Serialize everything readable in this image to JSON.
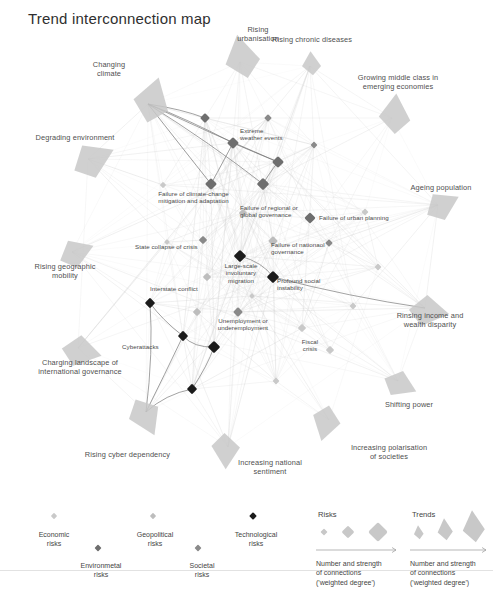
{
  "title": "Trend interconnection map",
  "colors": {
    "economic": "#c9c9c9",
    "environmental": "#6e6e6e",
    "geopolitical": "#bdbdbd",
    "societal": "#8a8a8a",
    "technological": "#1b1b1b",
    "trend_fill": "#c8c8c8",
    "edge": "#cfcfcf",
    "edge_strong": "#6d6d6d",
    "text": "#4a4a4a"
  },
  "chart_data": {
    "type": "network",
    "title": "Trend interconnection map",
    "xlabel": "",
    "ylabel": "",
    "grid": false,
    "legend_position": "bottom",
    "node_categories": [
      {
        "key": "economic",
        "label": "Economic\nrisks",
        "color": "#c9c9c9"
      },
      {
        "key": "environmental",
        "label": "Environmetal\nrisks",
        "color": "#6e6e6e"
      },
      {
        "key": "geopolitical",
        "label": "Geopolitical\nrisks",
        "color": "#bdbdbd"
      },
      {
        "key": "societal",
        "label": "Societal\nrisks",
        "color": "#8a8a8a"
      },
      {
        "key": "technological",
        "label": "Technological\nrisks",
        "color": "#1b1b1b"
      }
    ],
    "trends": [
      {
        "id": "t_climate",
        "label": "Changing\nclimate",
        "x": 148,
        "y": 104,
        "size": 46,
        "rot": 22,
        "lx": 74,
        "ly": 60,
        "lw": 70
      },
      {
        "id": "t_urban",
        "label": "Rising\nurbanisation",
        "x": 240,
        "y": 62,
        "size": 44,
        "rot": -6,
        "lx": 227,
        "ly": 25,
        "lw": 62
      },
      {
        "id": "t_chronic",
        "label": "Rising chronic diseases",
        "x": 310,
        "y": 66,
        "size": 24,
        "rot": 2,
        "lx": 252,
        "ly": 35,
        "lw": 120
      },
      {
        "id": "t_middleclass",
        "label": "Growing middle class in\nemerging economies",
        "x": 392,
        "y": 118,
        "size": 40,
        "rot": 10,
        "lx": 333,
        "ly": 73,
        "lw": 130
      },
      {
        "id": "t_degrading",
        "label": "Degrading environment",
        "x": 88,
        "y": 159,
        "size": 44,
        "rot": 70,
        "lx": 20,
        "ly": 133,
        "lw": 110
      },
      {
        "id": "t_ageing",
        "label": "Ageing population",
        "x": 438,
        "y": 205,
        "size": 36,
        "rot": 68,
        "lx": 396,
        "ly": 183,
        "lw": 90
      },
      {
        "id": "t_geomobility",
        "label": "Rising geographic\nmobility",
        "x": 72,
        "y": 252,
        "size": 36,
        "rot": 74,
        "lx": 20,
        "ly": 262,
        "lw": 90
      },
      {
        "id": "t_income",
        "label": "Rinsing income and\nwealth disparity",
        "x": 425,
        "y": 308,
        "size": 40,
        "rot": 104,
        "lx": 374,
        "ly": 311,
        "lw": 112
      },
      {
        "id": "t_intgov",
        "label": "Charging landscape of\ninternational governance",
        "x": 78,
        "y": 348,
        "size": 40,
        "rot": 108,
        "lx": 18,
        "ly": 358,
        "lw": 124
      },
      {
        "id": "t_shifting",
        "label": "Shifting power",
        "x": 398,
        "y": 381,
        "size": 34,
        "rot": 120,
        "lx": 369,
        "ly": 400,
        "lw": 80
      },
      {
        "id": "t_cyberdep",
        "label": "Rising cyber dependency",
        "x": 146,
        "y": 412,
        "size": 40,
        "rot": 160,
        "lx": 70,
        "ly": 450,
        "lw": 115
      },
      {
        "id": "t_natsentiment",
        "label": "Increasing national\nsentiment",
        "x": 228,
        "y": 447,
        "size": 36,
        "rot": 186,
        "lx": 222,
        "ly": 458,
        "lw": 96
      },
      {
        "id": "t_polarisation",
        "label": "Increasing polarisation\nof societies",
        "x": 329,
        "y": 420,
        "size": 36,
        "rot": 200,
        "lx": 329,
        "ly": 443,
        "lw": 120
      }
    ],
    "risk_nodes": [
      {
        "id": "r01",
        "label": "Extreme\nweather events",
        "x": 233,
        "y": 143,
        "cat": "environmental",
        "size": 8.5,
        "lx": 240,
        "ly": 127,
        "lw": 70,
        "align": "left"
      },
      {
        "id": "r02",
        "label": "",
        "x": 205,
        "y": 118,
        "cat": "environmental",
        "size": 7
      },
      {
        "id": "r03",
        "label": "",
        "x": 268,
        "y": 118,
        "cat": "societal",
        "size": 5.5
      },
      {
        "id": "r04",
        "label": "",
        "x": 314,
        "y": 145,
        "cat": "societal",
        "size": 5
      },
      {
        "id": "r05",
        "label": "",
        "x": 278,
        "y": 162,
        "cat": "environmental",
        "size": 8.5
      },
      {
        "id": "r06",
        "label": "",
        "x": 263,
        "y": 184,
        "cat": "environmental",
        "size": 9
      },
      {
        "id": "r07",
        "label": "Failure of climate-change\nmitigation and adaptation",
        "x": 211,
        "y": 184,
        "cat": "environmental",
        "size": 8.5,
        "lx": 141,
        "ly": 190,
        "lw": 105
      },
      {
        "id": "r08",
        "label": "Failure of regional or\nglobal governance",
        "x": 243,
        "y": 213,
        "cat": "geopolitical",
        "size": 6,
        "lx": 240,
        "ly": 204,
        "lw": 70,
        "align": "left"
      },
      {
        "id": "r09",
        "label": "Failure of urban planning",
        "x": 310,
        "y": 218,
        "cat": "environmental",
        "size": 8,
        "lx": 319,
        "ly": 214,
        "lw": 86,
        "align": "left"
      },
      {
        "id": "r10",
        "label": "",
        "x": 365,
        "y": 212,
        "cat": "economic",
        "size": 5
      },
      {
        "id": "r11",
        "label": "Failure of nationaol\ngovernance",
        "x": 273,
        "y": 241,
        "cat": "geopolitical",
        "size": 7,
        "lx": 271,
        "ly": 241,
        "lw": 62,
        "align": "left"
      },
      {
        "id": "r12",
        "label": "State collapse of crisis",
        "x": 203,
        "y": 240,
        "cat": "societal",
        "size": 6,
        "lx": 135,
        "ly": 243,
        "lw": 82,
        "align": "left"
      },
      {
        "id": "r13",
        "label": "Large-scale\ninvoluntary\nmigration",
        "x": 240,
        "y": 256,
        "cat": "technological",
        "size": 9,
        "lx": 215,
        "ly": 262,
        "lw": 52
      },
      {
        "id": "r14",
        "label": "Profound social\ninstability",
        "x": 273,
        "y": 277,
        "cat": "technological",
        "size": 9,
        "lx": 277,
        "ly": 277,
        "lw": 64,
        "align": "left"
      },
      {
        "id": "r15",
        "label": "Interstate conflict",
        "x": 207,
        "y": 277,
        "cat": "geopolitical",
        "size": 6,
        "lx": 150,
        "ly": 285,
        "lw": 66,
        "align": "left"
      },
      {
        "id": "r16",
        "label": "",
        "x": 167,
        "y": 242,
        "cat": "economic",
        "size": 4
      },
      {
        "id": "r17",
        "label": "",
        "x": 329,
        "y": 243,
        "cat": "societal",
        "size": 5.5
      },
      {
        "id": "r18",
        "label": "",
        "x": 378,
        "y": 267,
        "cat": "economic",
        "size": 5
      },
      {
        "id": "r19",
        "label": "Unemployment or\nunderemployment",
        "x": 214,
        "y": 347,
        "cat": "technological",
        "size": 9,
        "lx": 206,
        "ly": 317,
        "lw": 74
      },
      {
        "id": "r20",
        "label": "",
        "x": 197,
        "y": 312,
        "cat": "geopolitical",
        "size": 6
      },
      {
        "id": "r21",
        "label": "",
        "x": 238,
        "y": 312,
        "cat": "societal",
        "size": 7
      },
      {
        "id": "r22",
        "label": "",
        "x": 150,
        "y": 303,
        "cat": "technological",
        "size": 7.5
      },
      {
        "id": "r23",
        "label": "Cyberattacks",
        "x": 183,
        "y": 336,
        "cat": "technological",
        "size": 7.5,
        "lx": 122,
        "ly": 343,
        "lw": 66,
        "align": "left"
      },
      {
        "id": "r24",
        "label": "",
        "x": 192,
        "y": 389,
        "cat": "technological",
        "size": 7.5
      },
      {
        "id": "r25",
        "label": "Fiscal\ncrisis",
        "x": 302,
        "y": 328,
        "cat": "economic",
        "size": 6,
        "lx": 290,
        "ly": 338,
        "lw": 40
      },
      {
        "id": "r26",
        "label": "",
        "x": 330,
        "y": 350,
        "cat": "economic",
        "size": 6
      },
      {
        "id": "r27",
        "label": "",
        "x": 276,
        "y": 381,
        "cat": "economic",
        "size": 5
      },
      {
        "id": "r28",
        "label": "",
        "x": 353,
        "y": 306,
        "cat": "economic",
        "size": 5
      },
      {
        "id": "r29",
        "label": "",
        "x": 163,
        "y": 185,
        "cat": "economic",
        "size": 4.5
      },
      {
        "id": "r30",
        "label": "",
        "x": 252,
        "y": 296,
        "cat": "economic",
        "size": 4
      }
    ],
    "edges_strong": [
      [
        "t_climate",
        "r01"
      ],
      [
        "t_climate",
        "r07"
      ],
      [
        "t_climate",
        "r05"
      ],
      [
        "t_climate",
        "r06"
      ],
      [
        "t_climate",
        "r02"
      ],
      [
        "r07",
        "r01"
      ],
      [
        "r06",
        "r05"
      ],
      [
        "r01",
        "r05"
      ],
      [
        "r22",
        "r23"
      ],
      [
        "r23",
        "t_cyberdep"
      ],
      [
        "r22",
        "t_cyberdep"
      ],
      [
        "r24",
        "t_cyberdep"
      ],
      [
        "r19",
        "r24"
      ],
      [
        "r19",
        "r23"
      ],
      [
        "r14",
        "t_income"
      ],
      [
        "r13",
        "r14"
      ]
    ],
    "series": [
      {
        "name": "Risks",
        "values": []
      },
      {
        "name": "Trends",
        "values": []
      }
    ]
  },
  "legend": {
    "categories": [
      {
        "label": "Economic\nrisks",
        "color": "#c9c9c9",
        "x": 50,
        "y": 38,
        "mx": 54,
        "my": 24,
        "size": 4.5
      },
      {
        "label": "Environmetal\nrisks",
        "color": "#6e6e6e",
        "x": 97,
        "y": 69,
        "mx": 98,
        "my": 56,
        "size": 5
      },
      {
        "label": "Geopolitical\nrisks",
        "color": "#bdbdbd",
        "x": 151,
        "y": 38,
        "mx": 153,
        "my": 24,
        "size": 4.5
      },
      {
        "label": "Societal\nrisks",
        "color": "#8a8a8a",
        "x": 198,
        "y": 69,
        "mx": 198,
        "my": 56,
        "size": 5
      },
      {
        "label": "Technological\nrisks",
        "color": "#1b1b1b",
        "x": 252,
        "y": 38,
        "mx": 253,
        "my": 24,
        "size": 5.5
      }
    ],
    "scales": [
      {
        "key": "risks",
        "heading": "Risks",
        "hx": 318,
        "hy": 18,
        "caption": "Number and strength\nof connections\n('weighted degree')",
        "cx": 316,
        "cy": 67,
        "arrow_x1": 316,
        "arrow_x2": 396,
        "arrow_y": 58,
        "marks": [
          {
            "x": 324,
            "y": 40,
            "size": 5
          },
          {
            "x": 348,
            "y": 40,
            "size": 9
          },
          {
            "x": 378,
            "y": 40,
            "size": 14
          }
        ]
      },
      {
        "key": "trends",
        "heading": "Trends",
        "hx": 412,
        "hy": 18,
        "caption": "Number and strength\nof connections\n('weighted degree')",
        "cx": 410,
        "cy": 67,
        "arrow_x1": 410,
        "arrow_x2": 486,
        "arrow_y": 58,
        "marks": [
          {
            "x": 418,
            "y": 42,
            "size": 14
          },
          {
            "x": 444,
            "y": 40,
            "size": 22
          },
          {
            "x": 472,
            "y": 38,
            "size": 32
          }
        ]
      }
    ]
  }
}
